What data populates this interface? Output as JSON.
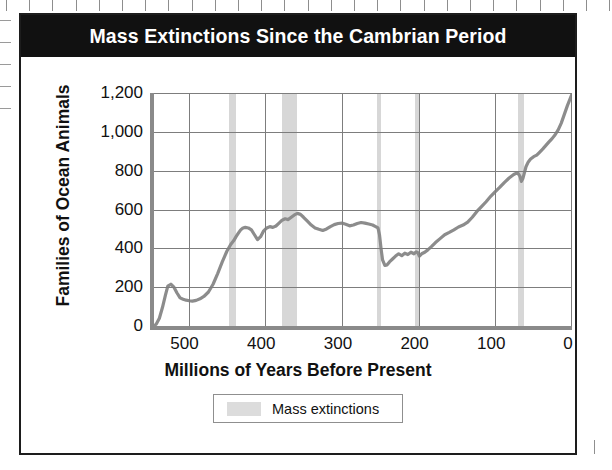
{
  "figure": {
    "title": "Mass Extinctions Since the Cambrian Period"
  },
  "legend": {
    "label": "Mass extinctions",
    "swatch_color": "#d7d7d7"
  },
  "colors": {
    "title_banner": "#111111",
    "title_text": "#ffffff",
    "frame_border": "#1d1d1d",
    "axis": "#8a8a8a",
    "gridline": "#7d7d7d",
    "data_line": "#8c8c8c",
    "band": "#d7d7d7"
  },
  "chart_data": {
    "type": "line",
    "title": "Mass Extinctions Since the Cambrian Period",
    "xlabel": "Millions of Years Before Present",
    "ylabel": "Families of Ocean Animals",
    "xlim": [
      545,
      0
    ],
    "ylim": [
      0,
      1200
    ],
    "x_reversed": true,
    "grid": true,
    "xticks": [
      500,
      400,
      300,
      200,
      100,
      0
    ],
    "xtick_labels": [
      "500",
      "400",
      "300",
      "200",
      "100",
      "0"
    ],
    "yticks": [
      0,
      200,
      400,
      600,
      800,
      1000,
      1200
    ],
    "ytick_labels": [
      "0",
      "200",
      "400",
      "600",
      "800",
      "1,000",
      "1,200"
    ],
    "legend_position": "below-axis-center",
    "legend_entries": [
      "Mass extinctions"
    ],
    "series": [
      {
        "name": "Families of ocean animals",
        "x": [
          545,
          542,
          538,
          534,
          530,
          527,
          523,
          519,
          515,
          511,
          507,
          503,
          499,
          495,
          490,
          485,
          480,
          474,
          468,
          462,
          456,
          450,
          445,
          441,
          438,
          435,
          432,
          429,
          426,
          422,
          418,
          414,
          410,
          406,
          402,
          398,
          394,
          390,
          386,
          382,
          378,
          374,
          370,
          366,
          362,
          358,
          354,
          350,
          345,
          340,
          335,
          330,
          325,
          320,
          315,
          310,
          305,
          300,
          295,
          290,
          285,
          280,
          275,
          270,
          265,
          260,
          256,
          253,
          251,
          249,
          247,
          244,
          241,
          238,
          234,
          230,
          226,
          222,
          218,
          214,
          210,
          206,
          203,
          201,
          199,
          196,
          192,
          188,
          183,
          178,
          172,
          166,
          160,
          154,
          148,
          142,
          136,
          130,
          124,
          118,
          112,
          106,
          100,
          94,
          88,
          82,
          76,
          71,
          68,
          66,
          64,
          62,
          60,
          57,
          54,
          50,
          46,
          42,
          38,
          34,
          30,
          26,
          22,
          18,
          14,
          10,
          6,
          2,
          0
        ],
        "y": [
          0,
          10,
          40,
          95,
          160,
          205,
          215,
          200,
          170,
          145,
          138,
          133,
          130,
          128,
          132,
          140,
          152,
          175,
          215,
          270,
          330,
          385,
          420,
          440,
          460,
          478,
          495,
          505,
          508,
          505,
          495,
          470,
          445,
          460,
          490,
          505,
          512,
          508,
          515,
          530,
          545,
          552,
          548,
          560,
          572,
          580,
          575,
          560,
          540,
          520,
          505,
          498,
          492,
          500,
          512,
          522,
          528,
          530,
          524,
          516,
          520,
          528,
          533,
          530,
          525,
          520,
          512,
          505,
          470,
          400,
          340,
          312,
          315,
          330,
          345,
          360,
          372,
          362,
          375,
          368,
          380,
          372,
          382,
          378,
          360,
          372,
          380,
          392,
          410,
          430,
          450,
          470,
          482,
          495,
          510,
          520,
          535,
          560,
          590,
          615,
          640,
          668,
          692,
          715,
          740,
          762,
          780,
          790,
          772,
          745,
          760,
          790,
          820,
          845,
          860,
          872,
          880,
          896,
          912,
          930,
          948,
          965,
          985,
          1010,
          1045,
          1090,
          1135,
          1175,
          1195
        ]
      }
    ],
    "mass_extinction_bands": [
      {
        "start": 447,
        "end": 438,
        "label": "End-Ordovician"
      },
      {
        "start": 378,
        "end": 358,
        "label": "Late Devonian"
      },
      {
        "start": 254,
        "end": 249,
        "label": "End-Permian"
      },
      {
        "start": 205,
        "end": 200,
        "label": "End-Triassic"
      },
      {
        "start": 70,
        "end": 63,
        "label": "End-Cretaceous"
      }
    ]
  }
}
